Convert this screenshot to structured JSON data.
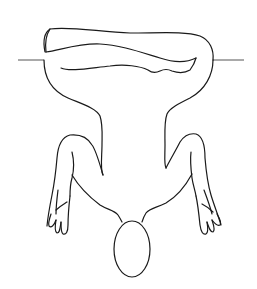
{
  "figure": {
    "colors": {
      "background": "#ffffff",
      "line": "#1a1a1a",
      "guide_line": "#555555"
    },
    "parts": {
      "guide_line_left": "horizontal-reference-line",
      "guide_line_right": "horizontal-reference-line",
      "legs": "folded-legs",
      "torso": "torso",
      "left_arm": "left-arm",
      "right_arm": "right-arm",
      "left_hand": "left-hand",
      "right_hand": "right-hand",
      "head": "head"
    }
  }
}
